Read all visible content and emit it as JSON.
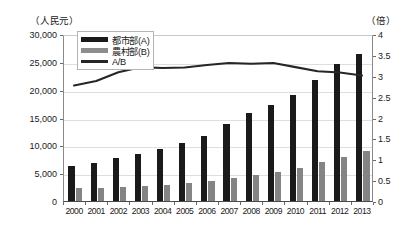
{
  "chart_data": {
    "type": "bar",
    "title": "",
    "subtitle": "",
    "xlabel": "",
    "ylabel": "（人民元）",
    "y2label": "（倍）",
    "ylim": [
      0,
      30000
    ],
    "y2lim": [
      0,
      4
    ],
    "yticks": [
      "0",
      "5,000",
      "10,000",
      "15,000",
      "20,000",
      "25,000",
      "30,000"
    ],
    "ytick_values": [
      0,
      5000,
      10000,
      15000,
      20000,
      25000,
      30000
    ],
    "y2ticks": [
      "0",
      "0.5",
      "1",
      "1.5",
      "2",
      "2.5",
      "3",
      "3.5",
      "4"
    ],
    "y2tick_values": [
      0,
      0.5,
      1,
      1.5,
      2,
      2.5,
      3,
      3.5,
      4
    ],
    "grid": true,
    "legend_position": "top-left",
    "categories": [
      "2000",
      "2001",
      "2002",
      "2003",
      "2004",
      "2005",
      "2006",
      "2007",
      "2008",
      "2009",
      "2010",
      "2011",
      "2012",
      "2013"
    ],
    "series": [
      {
        "name": "都市部(A)",
        "type": "bar",
        "axis": "left",
        "color": "#1a1a1a",
        "values": [
          6280,
          6860,
          7700,
          8470,
          9420,
          10490,
          11760,
          13790,
          15780,
          17170,
          19110,
          21810,
          24570,
          26470
        ]
      },
      {
        "name": "農村部(B)",
        "type": "bar",
        "axis": "left",
        "color": "#848484",
        "values": [
          2250,
          2370,
          2480,
          2620,
          2940,
          3260,
          3590,
          4140,
          4760,
          5150,
          5920,
          6980,
          7920,
          8900
        ]
      },
      {
        "name": "A/B",
        "type": "line",
        "axis": "right",
        "color": "#262626",
        "values": [
          2.79,
          2.9,
          3.11,
          3.23,
          3.21,
          3.22,
          3.28,
          3.33,
          3.31,
          3.33,
          3.23,
          3.13,
          3.1,
          3.03
        ]
      }
    ]
  },
  "legend": {
    "items": [
      {
        "label": "都市部(A)",
        "marker": "urban"
      },
      {
        "label": "農村部(B)",
        "marker": "rural"
      },
      {
        "label": "A/B",
        "marker": "ratio"
      }
    ]
  }
}
